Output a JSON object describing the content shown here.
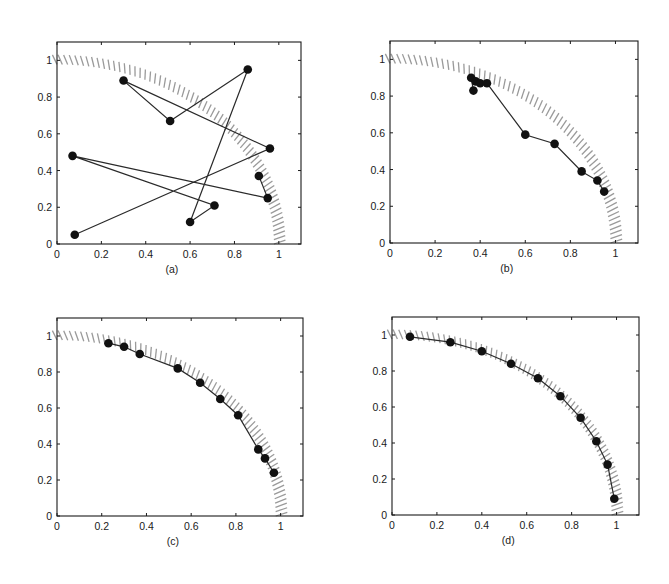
{
  "figure": {
    "panel_labels": [
      "(a)",
      "(b)",
      "(c)",
      "(d)"
    ]
  },
  "chart_data": [
    {
      "type": "line",
      "panel": "(a)",
      "title": "",
      "xlabel": "(a)",
      "ylabel": "",
      "xlim": [
        0,
        1.1
      ],
      "ylim": [
        0,
        1.1
      ],
      "xticks": [
        "0",
        "0.2",
        "0.4",
        "0.6",
        "0.8",
        "1"
      ],
      "yticks": [
        "0",
        "0.2",
        "0.4",
        "0.6",
        "0.8",
        "1"
      ],
      "grid": false,
      "reference_band": {
        "shape": "quarter-circle",
        "radius": 1.0,
        "style": "hatched"
      },
      "series": [
        {
          "name": "path",
          "markers": true,
          "connected": true,
          "x": [
            0.08,
            0.96,
            0.3,
            0.51,
            0.86,
            0.6,
            0.71,
            0.07,
            0.95,
            0.91
          ],
          "y": [
            0.05,
            0.52,
            0.89,
            0.67,
            0.95,
            0.12,
            0.21,
            0.48,
            0.25,
            0.37
          ]
        }
      ]
    },
    {
      "type": "line",
      "panel": "(b)",
      "title": "",
      "xlabel": "(b)",
      "ylabel": "",
      "xlim": [
        0,
        1.1
      ],
      "ylim": [
        0,
        1.1
      ],
      "xticks": [
        "0",
        "0.2",
        "0.4",
        "0.6",
        "0.8",
        "1"
      ],
      "yticks": [
        "0",
        "0.2",
        "0.4",
        "0.6",
        "0.8",
        "1"
      ],
      "grid": false,
      "reference_band": {
        "shape": "quarter-circle",
        "radius": 1.0,
        "style": "hatched"
      },
      "series": [
        {
          "name": "path",
          "markers": true,
          "connected": true,
          "x": [
            0.37,
            0.36,
            0.38,
            0.4,
            0.43,
            0.6,
            0.73,
            0.85,
            0.92,
            0.95
          ],
          "y": [
            0.83,
            0.9,
            0.88,
            0.87,
            0.87,
            0.59,
            0.54,
            0.39,
            0.34,
            0.28
          ]
        }
      ]
    },
    {
      "type": "line",
      "panel": "(c)",
      "title": "",
      "xlabel": "(c)",
      "ylabel": "",
      "xlim": [
        0,
        1.1
      ],
      "ylim": [
        0,
        1.1
      ],
      "xticks": [
        "0",
        "0.2",
        "0.4",
        "0.6",
        "0.8",
        "1"
      ],
      "yticks": [
        "0",
        "0.2",
        "0.4",
        "0.6",
        "0.8",
        "1"
      ],
      "grid": false,
      "reference_band": {
        "shape": "quarter-circle",
        "radius": 1.0,
        "style": "hatched"
      },
      "series": [
        {
          "name": "path",
          "markers": true,
          "connected": true,
          "x": [
            0.23,
            0.3,
            0.37,
            0.54,
            0.64,
            0.73,
            0.81,
            0.9,
            0.93,
            0.97
          ],
          "y": [
            0.96,
            0.94,
            0.9,
            0.82,
            0.74,
            0.65,
            0.56,
            0.37,
            0.32,
            0.24
          ]
        }
      ]
    },
    {
      "type": "line",
      "panel": "(d)",
      "title": "",
      "xlabel": "(d)",
      "ylabel": "",
      "xlim": [
        0,
        1.1
      ],
      "ylim": [
        0,
        1.1
      ],
      "xticks": [
        "0",
        "0.2",
        "0.4",
        "0.6",
        "0.8",
        "1"
      ],
      "yticks": [
        "0",
        "0.2",
        "0.4",
        "0.6",
        "0.8",
        "1"
      ],
      "grid": false,
      "reference_band": {
        "shape": "quarter-circle",
        "radius": 1.0,
        "style": "hatched"
      },
      "series": [
        {
          "name": "path",
          "markers": true,
          "connected": true,
          "x": [
            0.08,
            0.26,
            0.4,
            0.53,
            0.65,
            0.75,
            0.84,
            0.91,
            0.96,
            0.99
          ],
          "y": [
            0.99,
            0.96,
            0.91,
            0.84,
            0.76,
            0.66,
            0.54,
            0.41,
            0.28,
            0.09
          ]
        }
      ]
    }
  ],
  "layout": {
    "panels": [
      {
        "left": 57,
        "top": 42,
        "right": 301,
        "bottom": 244
      },
      {
        "left": 390,
        "top": 41,
        "right": 638,
        "bottom": 243
      },
      {
        "left": 57,
        "top": 318,
        "right": 303,
        "bottom": 516
      },
      {
        "left": 392,
        "top": 317,
        "right": 639,
        "bottom": 515
      }
    ]
  }
}
